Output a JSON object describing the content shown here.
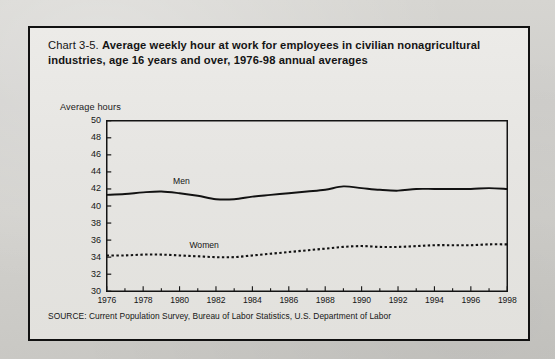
{
  "document": {
    "chart_number": "Chart 3-5.",
    "title_bold": "Average weekly hour at work for employees in civilian nonagricultural industries, age 16 years and over, 1976-98 annual averages",
    "source": "SOURCE: Current Population Survey, Bureau of Labor Statistics, U.S. Department of Labor",
    "axis_caption": "Average hours"
  },
  "chart_data": {
    "type": "line",
    "title": "Chart 3-5. Average weekly hour at work for employees in civilian nonagricultural industries, age 16 years and over, 1976-98 annual averages",
    "xlabel": "",
    "ylabel": "Average hours",
    "ylim": [
      30,
      50
    ],
    "xlim": [
      1976,
      1998
    ],
    "yticks": [
      30,
      32,
      34,
      36,
      38,
      40,
      42,
      44,
      46,
      48,
      50
    ],
    "xticks": [
      1976,
      1978,
      1980,
      1982,
      1984,
      1986,
      1988,
      1990,
      1992,
      1994,
      1996,
      1998
    ],
    "xtick_labels": [
      "1976",
      "1978",
      "1980",
      "1982",
      "1984",
      "1986",
      "1988",
      "1990",
      "1992",
      "1994",
      "1996",
      "1998"
    ],
    "grid": false,
    "legend": "inline-labels",
    "x": [
      1976,
      1977,
      1978,
      1979,
      1980,
      1981,
      1982,
      1983,
      1984,
      1985,
      1986,
      1987,
      1988,
      1989,
      1990,
      1991,
      1992,
      1993,
      1994,
      1995,
      1996,
      1997,
      1998
    ],
    "series": [
      {
        "name": "Men",
        "style": "solid",
        "label_position": "above-line-near-1980",
        "values": [
          41.3,
          41.4,
          41.6,
          41.7,
          41.5,
          41.2,
          40.8,
          40.8,
          41.1,
          41.3,
          41.5,
          41.7,
          41.9,
          42.3,
          42.1,
          41.9,
          41.8,
          42.0,
          42.0,
          42.0,
          42.0,
          42.1,
          42.0
        ]
      },
      {
        "name": "Women",
        "style": "dotted",
        "label_position": "above-line-near-1981",
        "values": [
          34.2,
          34.2,
          34.3,
          34.3,
          34.2,
          34.1,
          34.0,
          34.0,
          34.2,
          34.4,
          34.6,
          34.8,
          35.0,
          35.2,
          35.3,
          35.2,
          35.2,
          35.3,
          35.4,
          35.4,
          35.4,
          35.5,
          35.5
        ]
      }
    ]
  },
  "colors": {
    "ink": "#141414",
    "paper": "#e8e7e4",
    "page": "#ccccc8"
  }
}
